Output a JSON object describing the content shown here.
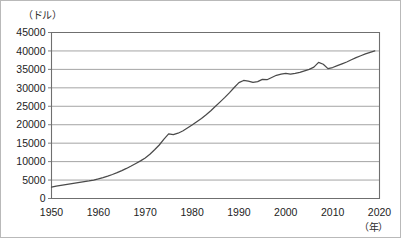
{
  "chart_data": {
    "type": "line",
    "title": "",
    "xlabel": "（年）",
    "ylabel": "（ドル）",
    "xlim": [
      1950,
      2020
    ],
    "ylim": [
      0,
      45000
    ],
    "grid": true,
    "legend": "none",
    "y_ticks": [
      "0",
      "5000",
      "10000",
      "15000",
      "20000",
      "25000",
      "30000",
      "35000",
      "40000",
      "45000"
    ],
    "y_tick_values": [
      0,
      5000,
      10000,
      15000,
      20000,
      25000,
      30000,
      35000,
      40000,
      45000
    ],
    "x_ticks": [
      "1950",
      "1960",
      "1970",
      "1980",
      "1990",
      "2000",
      "2010",
      "2020"
    ],
    "x_tick_values": [
      1950,
      1960,
      1970,
      1980,
      1990,
      2000,
      2010,
      2020
    ],
    "series": [
      {
        "name": "",
        "color": "#4a4a4a",
        "x": [
          1950,
          1951,
          1952,
          1953,
          1954,
          1955,
          1956,
          1957,
          1958,
          1959,
          1960,
          1961,
          1962,
          1963,
          1964,
          1965,
          1966,
          1967,
          1968,
          1969,
          1970,
          1971,
          1972,
          1973,
          1974,
          1975,
          1976,
          1977,
          1978,
          1979,
          1980,
          1981,
          1982,
          1983,
          1984,
          1985,
          1986,
          1987,
          1988,
          1989,
          1990,
          1991,
          1992,
          1993,
          1994,
          1995,
          1996,
          1997,
          1998,
          1999,
          2000,
          2001,
          2002,
          2003,
          2004,
          2005,
          2006,
          2007,
          2008,
          2009,
          2010,
          2011,
          2012,
          2013,
          2014,
          2015,
          2016,
          2017,
          2018,
          2019
        ],
        "y": [
          3100,
          3350,
          3550,
          3750,
          3950,
          4150,
          4350,
          4550,
          4750,
          5000,
          5300,
          5650,
          6050,
          6500,
          7000,
          7550,
          8150,
          8800,
          9500,
          10200,
          11000,
          12000,
          13200,
          14500,
          16100,
          17500,
          17300,
          17700,
          18300,
          19100,
          19900,
          20800,
          21700,
          22700,
          23800,
          25000,
          26200,
          27400,
          28700,
          30100,
          31400,
          32000,
          31800,
          31500,
          31700,
          32300,
          32200,
          32800,
          33400,
          33700,
          33900,
          33700,
          33900,
          34200,
          34600,
          35000,
          35600,
          36900,
          36400,
          35200,
          35500,
          36000,
          36500,
          37000,
          37600,
          38200,
          38700,
          39200,
          39600,
          40000
        ]
      }
    ],
    "annotations": [
      {
        "label": "1973-75 plateau",
        "value": 17500
      },
      {
        "label": "1991 peak",
        "value": 32000
      },
      {
        "label": "2007 peak",
        "value": 36900
      },
      {
        "label": "2009 trough",
        "value": 35200
      },
      {
        "label": "2019 end",
        "value": 40000
      }
    ]
  }
}
